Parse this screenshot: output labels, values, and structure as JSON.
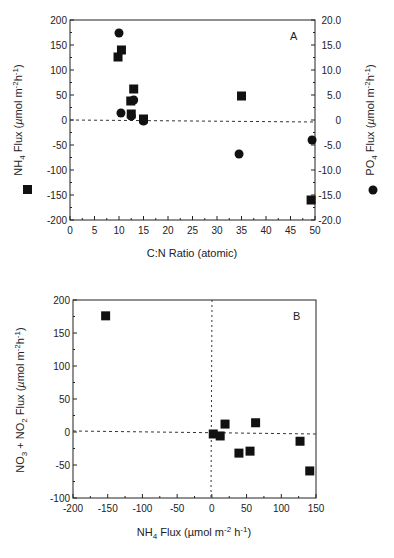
{
  "chart_data": [
    {
      "panel": "A",
      "type": "scatter",
      "xlabel": "C:N Ratio (atomic)",
      "ylabel": "NH4 Flux (µmol m-2 h-1)",
      "y2label": "PO4 Flux (µmol m-2 h-1)",
      "xlim": [
        0,
        50
      ],
      "ylim": [
        -200,
        200
      ],
      "y2lim": [
        -20,
        20
      ],
      "xticks": [
        "0",
        "5",
        "10",
        "15",
        "20",
        "25",
        "30",
        "35",
        "40",
        "45",
        "50"
      ],
      "yticks": [
        "200",
        "150",
        "100",
        "50",
        "0",
        "-50",
        "-100",
        "-150",
        "-200"
      ],
      "y2ticks": [
        "20.0",
        "15.0",
        "10.0",
        "5.0",
        "0",
        "-5.0",
        "-10.0",
        "-15.0",
        "-20.0"
      ],
      "reference_line": {
        "axis": "y",
        "value": 0,
        "style": "dashed"
      },
      "series": [
        {
          "name": "NH4 Flux",
          "marker": "square",
          "axis": "left",
          "points": [
            {
              "x": 9.8,
              "y": 126
            },
            {
              "x": 10.5,
              "y": 140
            },
            {
              "x": 13.0,
              "y": 62
            },
            {
              "x": 12.4,
              "y": 38
            },
            {
              "x": 12.5,
              "y": 12
            },
            {
              "x": 15.0,
              "y": 2
            },
            {
              "x": 35.0,
              "y": 48
            },
            {
              "x": 49.2,
              "y": -160
            }
          ]
        },
        {
          "name": "PO4 Flux",
          "marker": "circle",
          "axis": "right",
          "points": [
            {
              "x": 10.0,
              "y": 17.4
            },
            {
              "x": 13.0,
              "y": 4.0
            },
            {
              "x": 10.4,
              "y": 1.4
            },
            {
              "x": 12.5,
              "y": 0.8
            },
            {
              "x": 15.0,
              "y": -0.2
            },
            {
              "x": 34.5,
              "y": -6.8
            },
            {
              "x": 49.4,
              "y": -4.0
            }
          ]
        }
      ]
    },
    {
      "panel": "B",
      "type": "scatter",
      "xlabel": "NH4 Flux (µmol m-2 h-1)",
      "ylabel": "NO3 + NO2 Flux (µmol m-2 h-1)",
      "xlim": [
        -200,
        150
      ],
      "ylim": [
        -100,
        200
      ],
      "xticks": [
        "-200",
        "-150",
        "-100",
        "-50",
        "0",
        "50",
        "100",
        "150"
      ],
      "yticks": [
        "200",
        "150",
        "100",
        "50",
        "0",
        "-50",
        "-100"
      ],
      "reference_lines": [
        {
          "axis": "x",
          "value": 0,
          "style": "dotted"
        },
        {
          "axis": "y",
          "value": 0,
          "style": "dashed"
        }
      ],
      "series": [
        {
          "name": "NO3 + NO2 vs NH4",
          "marker": "square",
          "points": [
            {
              "x": -153,
              "y": 176
            },
            {
              "x": 2,
              "y": -3
            },
            {
              "x": 12,
              "y": -6
            },
            {
              "x": 19,
              "y": 12
            },
            {
              "x": 39,
              "y": -32
            },
            {
              "x": 55,
              "y": -29
            },
            {
              "x": 63,
              "y": 14
            },
            {
              "x": 127,
              "y": -14
            },
            {
              "x": 141,
              "y": -59
            }
          ]
        }
      ]
    }
  ],
  "labels": {
    "panelA": "A",
    "panelB": "B",
    "a_xlabel": "C:N Ratio (atomic)",
    "b_xlabel_main": "NH",
    "b_xlabel_sub": "4",
    "b_xlabel_rest": " Flux  (µmol  m",
    "b_xlabel_sup1": "-2",
    "b_xlabel_h": " h",
    "b_xlabel_sup2": "-1",
    "b_xlabel_close": ")"
  }
}
